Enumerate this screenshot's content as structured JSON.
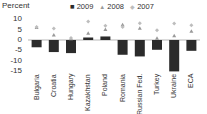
{
  "chart_data": {
    "type": "bar",
    "title": "",
    "ylabel": "Percent",
    "xlabel": "",
    "ylim": [
      -15,
      10
    ],
    "yticks": [
      10,
      5,
      0,
      -5,
      -10,
      -15
    ],
    "categories": [
      "Bulgaria",
      "Croatia",
      "Hungary",
      "Kazakhstan",
      "Poland",
      "Romania",
      "Russian Fed.",
      "Turkey",
      "Ukraine",
      "ECA"
    ],
    "series": [
      {
        "name": "2009",
        "marker": "bar",
        "color": "#2b2b2b",
        "values": [
          -3.5,
          -5.8,
          -6.3,
          1.2,
          1.7,
          -7.1,
          -7.9,
          -4.7,
          -15.1,
          -5.2
        ]
      },
      {
        "name": "2008",
        "marker": "triangle",
        "color": "#9a9a9a",
        "values": [
          6.0,
          2.4,
          0.6,
          3.2,
          5.0,
          7.3,
          5.6,
          0.9,
          2.1,
          4.2
        ]
      },
      {
        "name": "2007",
        "marker": "diamond",
        "color": "#bdbdbd",
        "values": [
          6.2,
          5.5,
          1.0,
          8.9,
          6.8,
          6.3,
          8.1,
          4.7,
          7.9,
          7.1
        ]
      }
    ],
    "legend_position": "top",
    "grid": false
  },
  "legend": {
    "items": [
      {
        "symbol": "■",
        "label": "2009"
      },
      {
        "symbol": "▲",
        "label": "2008"
      },
      {
        "symbol": "◆",
        "label": "2007"
      }
    ]
  }
}
